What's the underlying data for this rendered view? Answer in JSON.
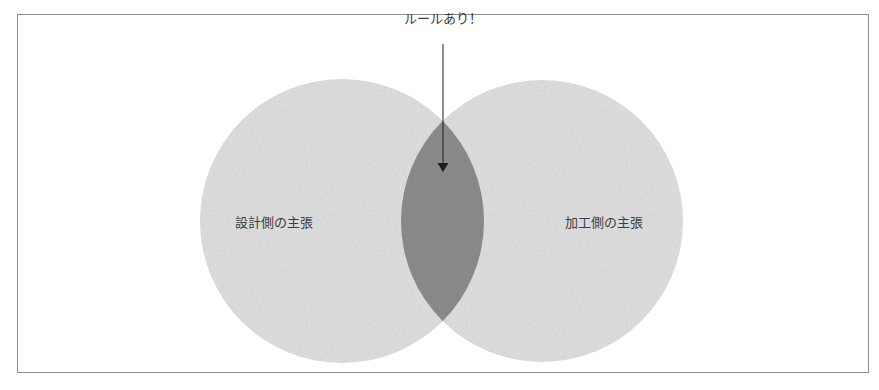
{
  "diagram": {
    "type": "venn",
    "annotation": {
      "label": "ルールあり！",
      "arrow_target": "intersection"
    },
    "sets": [
      {
        "id": "left",
        "label": "設計側の主張"
      },
      {
        "id": "right",
        "label": "加工側の主張"
      }
    ],
    "intersection": {
      "label": ""
    },
    "colors": {
      "frame_border": "#8c8c8c",
      "circle_fill": "#e3e3e3",
      "intersection_fill": "#8f8f8f",
      "arrow": "#1e1e1e",
      "text": "#3c3c3c"
    }
  }
}
